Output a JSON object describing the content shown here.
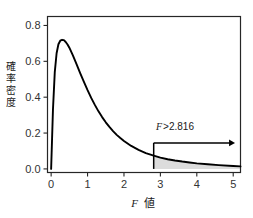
{
  "chart_data": {
    "type": "line",
    "title": "",
    "subtitle": "",
    "xlabel_italic": "F",
    "xlabel_suffix": "値",
    "ylabel": "確率密度",
    "ylabel_chars": [
      "確",
      "率",
      "密",
      "度"
    ],
    "xlim": [
      -0.1,
      5.2
    ],
    "ylim": [
      -0.02,
      0.85
    ],
    "xticks": [
      "0",
      "1",
      "2",
      "3",
      "4",
      "5"
    ],
    "xtick_values": [
      0,
      1,
      2,
      3,
      4,
      5
    ],
    "yticks": [
      "0.0",
      "0.2",
      "0.4",
      "0.6",
      "0.8"
    ],
    "ytick_values": [
      0.0,
      0.2,
      0.4,
      0.6,
      0.8
    ],
    "grid": false,
    "legend": false,
    "curve_color": "#000000",
    "shade_color": "#d9d9d9",
    "frame_color": "#262626",
    "series": [
      {
        "name": "F distribution density",
        "x": [
          0.0,
          0.05,
          0.1,
          0.15,
          0.2,
          0.25,
          0.3,
          0.35,
          0.4,
          0.45,
          0.5,
          0.6,
          0.7,
          0.8,
          0.9,
          1.0,
          1.1,
          1.2,
          1.3,
          1.4,
          1.5,
          1.6,
          1.7,
          1.8,
          1.9,
          2.0,
          2.2,
          2.4,
          2.6,
          2.816,
          3.0,
          3.2,
          3.4,
          3.6,
          3.8,
          4.0,
          4.3,
          4.6,
          5.0,
          5.2
        ],
        "y": [
          0.0,
          0.33,
          0.54,
          0.645,
          0.695,
          0.715,
          0.72,
          0.718,
          0.708,
          0.694,
          0.676,
          0.632,
          0.583,
          0.533,
          0.485,
          0.439,
          0.396,
          0.357,
          0.321,
          0.289,
          0.26,
          0.234,
          0.211,
          0.19,
          0.172,
          0.156,
          0.128,
          0.106,
          0.088,
          0.074,
          0.063,
          0.054,
          0.047,
          0.041,
          0.036,
          0.031,
          0.026,
          0.021,
          0.016,
          0.014
        ]
      }
    ],
    "annotations": [
      {
        "name": "critical-value-label",
        "italic_part": "F",
        "text_part": ">2.816",
        "x": 2.95,
        "y": 0.275
      }
    ],
    "critical_value": 2.816,
    "vertical_line_x": 2.816,
    "vertical_line_top": 0.145,
    "arrow_y": 0.145,
    "arrow_x_start": 2.816,
    "arrow_x_end": 5.05,
    "shaded_region": {
      "label": "rejection region tail",
      "from_x": 2.816,
      "to_x": 5.2
    }
  }
}
